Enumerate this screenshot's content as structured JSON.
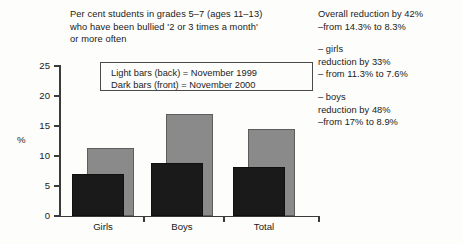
{
  "heading": {
    "lines": [
      "Per cent students in grades 5–7 (ages 11–13)",
      "who have been bullied '2 or 3 times a month'",
      "or more often"
    ]
  },
  "legend": {
    "light_line": "Light bars (back) = November 1999",
    "dark_line": "Dark bars  (front) = November 2000"
  },
  "notes": {
    "overall": {
      "line1": "Overall reduction by 42%",
      "line2": "–from 14.3% to 8.3%"
    },
    "girls": {
      "line1": "– girls",
      "line2": "reduction by 33%",
      "line3": "– from 11.3% to 7.6%"
    },
    "boys": {
      "line1": "– boys",
      "line2": "reduction by 48%",
      "line3": "–from 17% to 8.9%"
    }
  },
  "axis": {
    "y_label": "%",
    "y_ticks": [
      "0",
      "5",
      "10",
      "15",
      "20",
      "25"
    ],
    "x_labels": [
      "Girls",
      "Boys",
      "Total"
    ]
  },
  "colors": {
    "light_bar": "#8a8a8a",
    "dark_bar": "#1a1a1a",
    "axis": "#3b3b3b",
    "background": "#fdfdfb"
  },
  "chart_data": {
    "type": "bar",
    "title": "Per cent students in grades 5–7 (ages 11–13) who have been bullied '2 or 3 times a month' or more often",
    "xlabel": "",
    "ylabel": "%",
    "ylim": [
      0,
      25
    ],
    "ytick_values": [
      0,
      5,
      10,
      15,
      20,
      25
    ],
    "grid": false,
    "legend_position": "inside-top",
    "categories": [
      "Girls",
      "Boys",
      "Total"
    ],
    "series": [
      {
        "name": "November 1999",
        "color": "#8a8a8a",
        "values": [
          11.3,
          17.0,
          14.5
        ]
      },
      {
        "name": "November 2000",
        "color": "#1a1a1a",
        "values": [
          7.0,
          8.8,
          8.1
        ]
      }
    ],
    "annotations": [
      "Overall reduction by 42% –from 14.3% to 8.3%",
      "– girls reduction by 33% – from 11.3% to 7.6%",
      "– boys reduction by 48% –from 17% to 8.9%"
    ]
  }
}
